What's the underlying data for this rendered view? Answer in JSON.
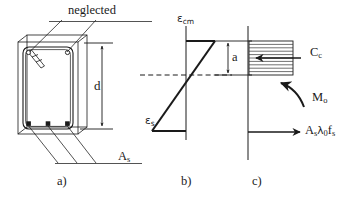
{
  "figure": {
    "line_color": "#1a1a1a",
    "hatch_color": "#333333",
    "background": "#ffffff"
  },
  "panels": [
    {
      "key": "a",
      "label": "a)",
      "caption": "cross section"
    },
    {
      "key": "b",
      "label": "b)",
      "caption": "strain distribution"
    },
    {
      "key": "c",
      "label": "c)",
      "caption": "stress block and resultants"
    }
  ],
  "annotations": {
    "neglected": "neglected",
    "effective_depth": "d",
    "steel_area": {
      "base": "A",
      "sub": "s"
    },
    "strain_concrete": {
      "greek": "ε",
      "sub": "cm"
    },
    "strain_steel": {
      "greek": "ε",
      "sub": "s"
    },
    "block_depth": "a",
    "concrete_force": {
      "base": "C",
      "sub": "c"
    },
    "moment": {
      "base": "M",
      "sub": "o"
    },
    "steel_force": {
      "part1_base": "A",
      "part1_sub": "s",
      "part2_base": "λ",
      "part2_sub": "0",
      "part3_base": "f",
      "part3_sub": "s"
    }
  },
  "geometry": {
    "section": {
      "x": 18,
      "y": 42,
      "width": 60,
      "height": 92
    },
    "depth_arrow": {
      "x": 102,
      "top": 44,
      "bottom": 128
    },
    "block_depth_arrow": {
      "x": 228,
      "top": 40,
      "bottom": 75
    },
    "neutral_axis_y": 75,
    "top_bars_count": 2,
    "bottom_bars_count": 3,
    "stress_block_hatch_lines": 9
  }
}
